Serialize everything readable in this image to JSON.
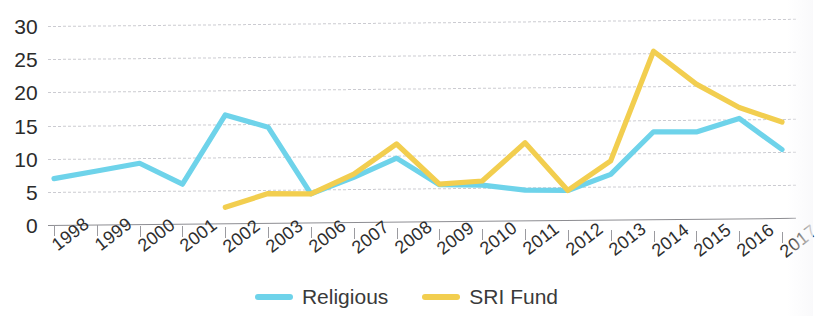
{
  "chart_data": {
    "type": "line",
    "title": "",
    "xlabel": "",
    "ylabel": "",
    "ylim": [
      0,
      30
    ],
    "yticks": [
      0,
      5,
      10,
      15,
      20,
      25,
      30
    ],
    "grid": true,
    "legend_position": "bottom-center",
    "categories": [
      "1998",
      "1999",
      "2000",
      "2001",
      "2002",
      "2003",
      "2006",
      "2007",
      "2008",
      "2009",
      "2010",
      "2011",
      "2012",
      "2013",
      "2014",
      "2015",
      "2016",
      "2017"
    ],
    "series": [
      {
        "name": "Religious",
        "color": "#6ed3ea",
        "values": [
          7.0,
          8.2,
          9.4,
          6.3,
          16.7,
          14.9,
          5.0,
          7.5,
          10.4,
          6.5,
          6.5,
          5.8,
          5.8,
          8.2,
          14.5,
          14.5,
          16.5,
          12.0
        ]
      },
      {
        "name": "SRI Fund",
        "color": "#f2ce4f",
        "values": [
          null,
          null,
          null,
          null,
          2.9,
          5.0,
          5.0,
          8.0,
          12.5,
          6.6,
          7.1,
          12.8,
          5.8,
          10.2,
          26.3,
          21.5,
          18.1,
          16.0
        ]
      }
    ]
  },
  "legend": {
    "items": [
      {
        "label": "Religious",
        "color": "#6ed3ea"
      },
      {
        "label": "SRI Fund",
        "color": "#f2ce4f"
      }
    ]
  }
}
